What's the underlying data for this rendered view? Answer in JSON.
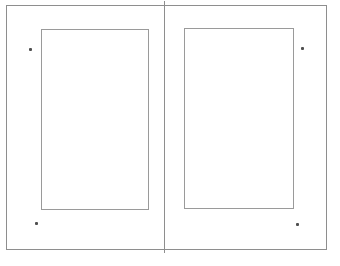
{
  "canvas": {
    "background_color": "#ffffff",
    "sheet_outline_color": "#8e8e8e",
    "spine_line_color": "#8e8e8e",
    "margin_box_color": "#9a9a9a",
    "dot_color": "#4f4f4f"
  },
  "spread": {
    "page_count": 2,
    "pages": [
      {
        "id": "left-page"
      },
      {
        "id": "right-page"
      }
    ],
    "dots": [
      {
        "position": "top-left"
      },
      {
        "position": "top-right"
      },
      {
        "position": "bottom-left"
      },
      {
        "position": "bottom-right"
      }
    ]
  }
}
